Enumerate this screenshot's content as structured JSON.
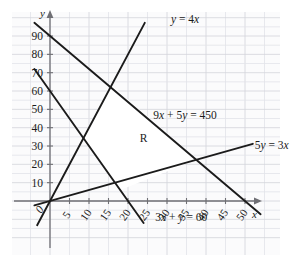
{
  "figure": {
    "kind": "coordinate-graph",
    "background_color": "#ffffff",
    "plot_area_color": "#fbfbfc",
    "grid_color": "#e2e3e8",
    "grid_major_color": "#d3d4da",
    "axis_color": "#6f6f74",
    "line_color": "#1b1b1b",
    "text_color": "#1b1b1b",
    "region_fill": "#ffffff"
  },
  "axes": {
    "x_label": "x",
    "y_label": "y",
    "x_ticks": [
      "0",
      "5",
      "10",
      "15",
      "20",
      "25",
      "30",
      "35",
      "40",
      "45",
      "50"
    ],
    "x_tick_values": [
      0,
      5,
      10,
      15,
      20,
      25,
      30,
      35,
      40,
      45,
      50
    ],
    "y_ticks": [
      "10",
      "20",
      "30",
      "40",
      "50",
      "60",
      "70",
      "80",
      "90"
    ],
    "y_tick_values": [
      10,
      20,
      30,
      40,
      50,
      60,
      70,
      80,
      90
    ],
    "origin_label": "0",
    "x_tick_rotation_deg": -55,
    "xlim": [
      -4,
      54
    ],
    "ylim": [
      -14,
      100
    ]
  },
  "region": {
    "label": "R",
    "label_x": 24,
    "label_y": 32,
    "vertices": [
      [
        15.79,
        63.16
      ],
      [
        8.57,
        34.29
      ],
      [
        18.0,
        6.0
      ],
      [
        37.71,
        22.63
      ]
    ]
  },
  "chart_data": {
    "type": "line",
    "title": "",
    "xlabel": "x",
    "ylabel": "y",
    "xlim": [
      -4,
      54
    ],
    "ylim": [
      -14,
      100
    ],
    "grid": true,
    "legend": "inline-annotations",
    "series": [
      {
        "name": "y = 4x",
        "label": "y = 4x",
        "equation": "y = 4x",
        "slope": 4,
        "intercept": 0,
        "label_x": 31,
        "label_y": 97,
        "x_from": -3.3,
        "x_to": 24.3
      },
      {
        "name": "9x + 5y = 450",
        "label": "9x + 5y = 450",
        "equation": "9x + 5y = 450",
        "slope": -1.8,
        "intercept": 90,
        "label_x": 26.5,
        "label_y": 45,
        "x_from": -4,
        "x_to": 54
      },
      {
        "name": "5y = 3x",
        "label": "5y = 3x",
        "equation": "5y = 3x",
        "slope": 0.6,
        "intercept": 0,
        "label_x": 52.5,
        "label_y": 28.5,
        "x_from": -4,
        "x_to": 52
      },
      {
        "name": "3x + y = 60",
        "label": "3x + y = 60",
        "equation": "3x + y = 60",
        "slope": -3,
        "intercept": 60,
        "label_x": 27,
        "label_y": -11,
        "x_from": -4,
        "x_to": 24
      }
    ]
  }
}
